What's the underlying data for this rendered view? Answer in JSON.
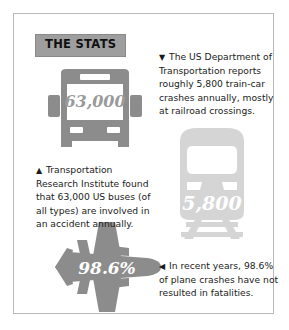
{
  "infographic": {
    "badge_label": "THE STATS",
    "border_color": "#b9b9b9",
    "background_color": "#ffffff",
    "badge_background_color": "#9e9e9e"
  },
  "figures": {
    "bus": {
      "name": "bus",
      "value_label": "63,000",
      "value_color": "#9a9a9a",
      "body_color": "#8c8c8c"
    },
    "train": {
      "name": "train",
      "value_label": "5,800",
      "value_color": "#ffffff",
      "body_color": "#d5d5d5"
    },
    "plane": {
      "name": "plane",
      "value_label": "98.6%",
      "value_color": "#ffffff",
      "body_color": "#8c8c8c"
    }
  },
  "callouts": {
    "train": {
      "marker": "▼",
      "text": "The US Department of Transportation reports roughly 5,800 train-car crashes annually, mostly at railroad crossings."
    },
    "bus": {
      "marker": "▲",
      "text": "Transportation Research Institute found that 63,000 US buses (of all types) are involved in an accident annually."
    },
    "plane": {
      "marker": "◀",
      "text": "In recent years, 98.6% of plane crashes have not resulted in fatalities."
    }
  }
}
